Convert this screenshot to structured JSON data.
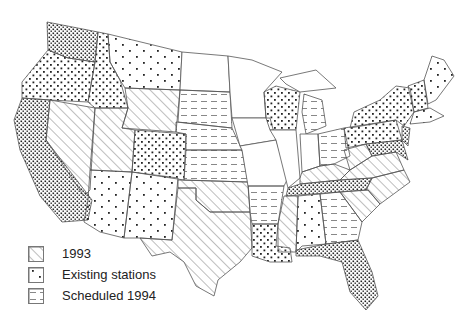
{
  "legend": {
    "items": [
      {
        "label": "1993",
        "pattern": "diagonal-hatch"
      },
      {
        "label": "Existing stations",
        "pattern": "dots"
      },
      {
        "label": "Scheduled 1994",
        "pattern": "dashes"
      }
    ]
  },
  "map": {
    "subject": "Contiguous United States",
    "states_1993": [
      "NV",
      "UT",
      "WY",
      "AZ",
      "NM",
      "OK",
      "TX",
      "MS",
      "KY",
      "VA",
      "NC",
      "SC",
      "WV"
    ],
    "states_existing": [
      "WA",
      "OR",
      "CA",
      "ID",
      "MT",
      "CO",
      "WI",
      "NY",
      "VT",
      "NH",
      "ME",
      "PA",
      "MD",
      "DE",
      "NJ",
      "TN",
      "AL",
      "LA",
      "FL",
      "GA-coast",
      "MA",
      "CT",
      "RI"
    ],
    "states_scheduled_1994": [
      "SD",
      "NE",
      "KS",
      "MI",
      "OH",
      "AR",
      "GA"
    ],
    "states_none": [
      "ND",
      "MN",
      "IA",
      "MO",
      "IL",
      "IN"
    ]
  },
  "colors": {
    "ink": "#222222",
    "background": "#ffffff",
    "border": "#555555"
  }
}
